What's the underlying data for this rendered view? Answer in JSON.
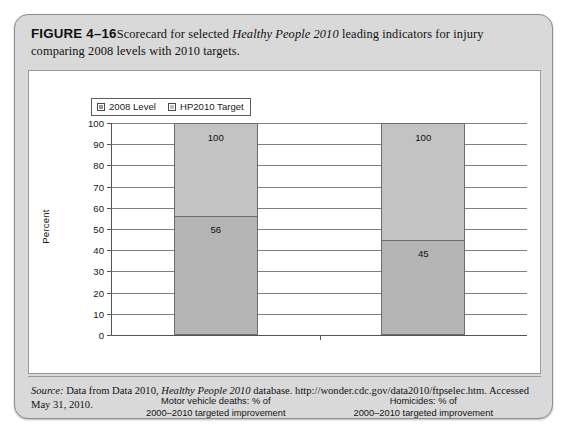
{
  "figure": {
    "label": "FIGURE 4–16",
    "caption_part1": "Scorecard for selected ",
    "caption_italic1": "Healthy People 2010",
    "caption_part2": " leading indicators for injury comparing 2008 levels with 2010 targets."
  },
  "source": {
    "prefix": "Source:",
    "text_part1": " Data from Data 2010, ",
    "italic1": "Healthy People 2010",
    "text_part2": " database. http://wonder.cdc.gov/data2010/ftpselec.htm. Accessed May 31, 2010."
  },
  "legend": {
    "items": [
      {
        "label": "2008 Level",
        "color": "#9b9b9b"
      },
      {
        "label": "HP2010 Target",
        "color": "#c0c0c0"
      }
    ]
  },
  "chart_data": {
    "type": "bar",
    "title": "",
    "xlabel": "",
    "ylabel": "Percent",
    "ylim": [
      0,
      100
    ],
    "ytick_labels": [
      "100",
      "90",
      "80",
      "70",
      "60",
      "50",
      "40",
      "30",
      "20",
      "10",
      "0"
    ],
    "ytick_values": [
      100,
      90,
      80,
      70,
      60,
      50,
      40,
      30,
      20,
      10,
      0
    ],
    "grid": true,
    "legend_position": "top-left",
    "categories": [
      "Motor vehicle deaths: % of\n2000–2010 targeted improvement\nachieved through 2008",
      "Homicides: % of\n2000–2010 targeted improvement\nachieved through 2008"
    ],
    "category_lines": [
      [
        "Motor vehicle deaths: % of",
        "2000–2010 targeted improvement",
        "achieved through 2008"
      ],
      [
        "Homicides: % of",
        "2000–2010 targeted improvement",
        "achieved through 2008"
      ]
    ],
    "series": [
      {
        "name": "HP2010 Target",
        "values": [
          100,
          100
        ]
      },
      {
        "name": "2008 Level",
        "values": [
          56,
          45
        ]
      }
    ],
    "data_labels": [
      {
        "category_index": 0,
        "target": "100",
        "level": "56"
      },
      {
        "category_index": 1,
        "target": "100",
        "level": "45"
      }
    ]
  }
}
